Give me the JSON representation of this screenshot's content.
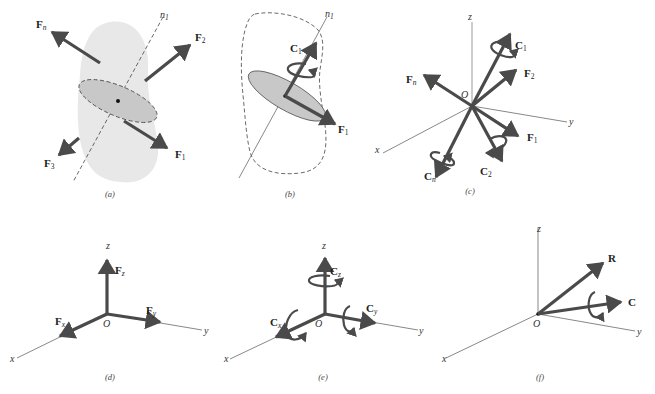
{
  "figure": {
    "panels": [
      {
        "id": "a",
        "caption": "(a)",
        "axis_label": "n",
        "axis_sub": "1",
        "forces": [
          {
            "name": "F",
            "sub": "n"
          },
          {
            "name": "F",
            "sub": "2"
          },
          {
            "name": "F",
            "sub": "3"
          },
          {
            "name": "F",
            "sub": "1"
          }
        ]
      },
      {
        "id": "b",
        "caption": "(b)",
        "axis_label": "n",
        "axis_sub": "1",
        "couples": [
          {
            "name": "C",
            "sub": "1"
          }
        ],
        "forces": [
          {
            "name": "F",
            "sub": "1"
          }
        ]
      },
      {
        "id": "c",
        "caption": "(c)",
        "origin": "O",
        "axes": {
          "x": "x",
          "y": "y",
          "z": "z"
        },
        "forces": [
          {
            "name": "F",
            "sub": "n"
          },
          {
            "name": "F",
            "sub": "2"
          },
          {
            "name": "F",
            "sub": "1"
          }
        ],
        "couples": [
          {
            "name": "C",
            "sub": "1"
          },
          {
            "name": "C",
            "sub": "2"
          },
          {
            "name": "C",
            "sub": "n"
          }
        ]
      },
      {
        "id": "d",
        "caption": "(d)",
        "origin": "O",
        "axes": {
          "x": "x",
          "y": "y",
          "z": "z"
        },
        "forces": [
          {
            "name": "F",
            "sub": "z"
          },
          {
            "name": "F",
            "sub": "y"
          },
          {
            "name": "F",
            "sub": "x"
          }
        ]
      },
      {
        "id": "e",
        "caption": "(e)",
        "origin": "O",
        "axes": {
          "x": "x",
          "y": "y",
          "z": "z"
        },
        "couples": [
          {
            "name": "C",
            "sub": "z"
          },
          {
            "name": "C",
            "sub": "y"
          },
          {
            "name": "C",
            "sub": "x"
          }
        ]
      },
      {
        "id": "f",
        "caption": "(f)",
        "origin": "O",
        "axes": {
          "x": "x",
          "y": "y",
          "z": "z"
        },
        "resultant_force": "R",
        "resultant_couple": "C"
      }
    ],
    "colors": {
      "vector": "#4a4a4a",
      "body_fill": "#e8e8e8",
      "section_fill": "#c8c8c8",
      "axis": "#555555"
    }
  }
}
